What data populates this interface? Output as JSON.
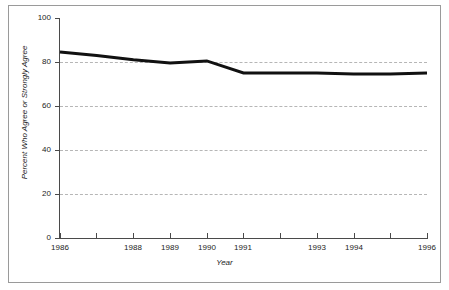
{
  "chart_data": {
    "type": "line",
    "title": "",
    "xlabel": "Year",
    "ylabel": "Percent Who Agree or Strongly Agree",
    "x": [
      1986,
      1987,
      1988,
      1989,
      1990,
      1991,
      1992,
      1993,
      1994,
      1995,
      1996
    ],
    "xtick_labels": [
      "1986",
      "",
      "1988",
      "1989",
      "1990",
      "1991",
      "",
      "1993",
      "1994",
      "",
      "1996"
    ],
    "xlim": [
      1986,
      1996
    ],
    "ylim": [
      0,
      100
    ],
    "yticks": [
      0,
      20,
      40,
      60,
      80,
      100
    ],
    "ytick_labels": [
      "0",
      "20",
      "40",
      "60",
      "80",
      "100"
    ],
    "grid": "horizontal-dashed",
    "legend": "none",
    "series": [
      {
        "name": "Percent Who Agree or Strongly Agree",
        "values": [
          84.5,
          83,
          81,
          79.5,
          80.5,
          75,
          75,
          75,
          74.5,
          74.5,
          75
        ],
        "color": "#111111",
        "line_width": 3
      }
    ]
  },
  "axis": {
    "y_title": "Percent Who Agree or Strongly Agree",
    "x_title": "Year"
  },
  "colors": {
    "series_line": "#111111",
    "axis": "#4a4a4a",
    "grid": "#b6b6b6",
    "frame": "#9a9a9a",
    "text": "#1c1c1c",
    "background": "#ffffff"
  }
}
